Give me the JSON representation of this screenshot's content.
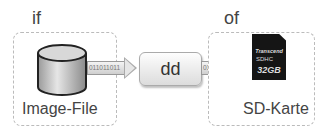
{
  "diagram": {
    "input": {
      "top_label": "if",
      "label": "Image-File",
      "icon": "database-cylinder-icon"
    },
    "process": {
      "label": "dd"
    },
    "output": {
      "top_label": "of",
      "label": "SD-Karte",
      "icon": "sd-card-icon",
      "card": {
        "brand": "Transcend",
        "type": "SDHC",
        "capacity": "32GB"
      }
    },
    "arrows": [
      {
        "bits": "011011011"
      },
      {
        "bits": "011011011"
      }
    ]
  }
}
